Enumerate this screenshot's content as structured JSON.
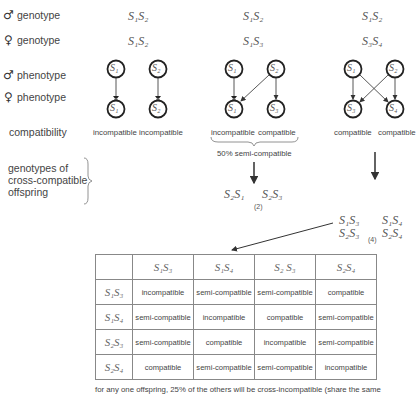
{
  "rows": {
    "male_genotype": {
      "symbol": "♂",
      "label": "genotype"
    },
    "female_genotype": {
      "symbol": "♀",
      "label": "genotype"
    },
    "male_phenotype": {
      "symbol": "♂",
      "label": "phenotype"
    },
    "female_phenotype": {
      "symbol": "♀",
      "label": "phenotype"
    },
    "compatibility": {
      "label": "compatibility"
    },
    "offspring": {
      "label_lines": [
        "genotypes of",
        "cross-compatible",
        "offspring"
      ]
    }
  },
  "crosses": [
    {
      "male_genotype": "S₁S₂",
      "female_genotype": "S₁S₂",
      "male_nodes": [
        "S₁",
        "S₂"
      ],
      "female_nodes": [
        "S₁",
        "S₂"
      ],
      "compatibility": [
        "incompatible",
        "incompatible"
      ]
    },
    {
      "male_genotype": "S₁S₂",
      "female_genotype": "S₁S₃",
      "male_nodes": [
        "S₁",
        "S₂"
      ],
      "female_nodes": [
        "S₁",
        "S₃"
      ],
      "compatibility": [
        "incompatible",
        "compatible"
      ],
      "summary": "50% semi-compatible",
      "offspring": [
        "S₂S₁",
        "S₂S₃"
      ],
      "offspring_count": "(2)"
    },
    {
      "male_genotype": "S₁S₂",
      "female_genotype": "S₃S₄",
      "male_nodes": [
        "S₁",
        "S₂"
      ],
      "female_nodes": [
        "S₃",
        "S₄"
      ],
      "compatibility": [
        "compatible",
        "compatible"
      ],
      "offspring": [
        "S₁S₃",
        "S₁S₄",
        "S₂S₃",
        "S₂S₄"
      ],
      "offspring_count": "(4)"
    }
  ],
  "matrix": {
    "col_headers": [
      "S₁S₃",
      "S₁S₄",
      "S₂ S₃",
      "S₂S₄"
    ],
    "rows": [
      {
        "header": "S₁S₃",
        "cells": [
          "incompatible",
          "semi-compatible",
          "semi-compatible",
          "compatible"
        ]
      },
      {
        "header": "S₁S₄",
        "cells": [
          "semi-compatible",
          "incompatible",
          "compatible",
          "semi-compatible"
        ]
      },
      {
        "header": "S₂S₃",
        "cells": [
          "semi-compatible",
          "compatible",
          "incompatible",
          "semi-compatible"
        ]
      },
      {
        "header": "S₂S₄",
        "cells": [
          "compatible",
          "semi-compatible",
          "semi-compatible",
          "incompatible"
        ]
      }
    ]
  },
  "footer": "for any one offspring, 25% of the others will be cross-incompatible (share the same"
}
